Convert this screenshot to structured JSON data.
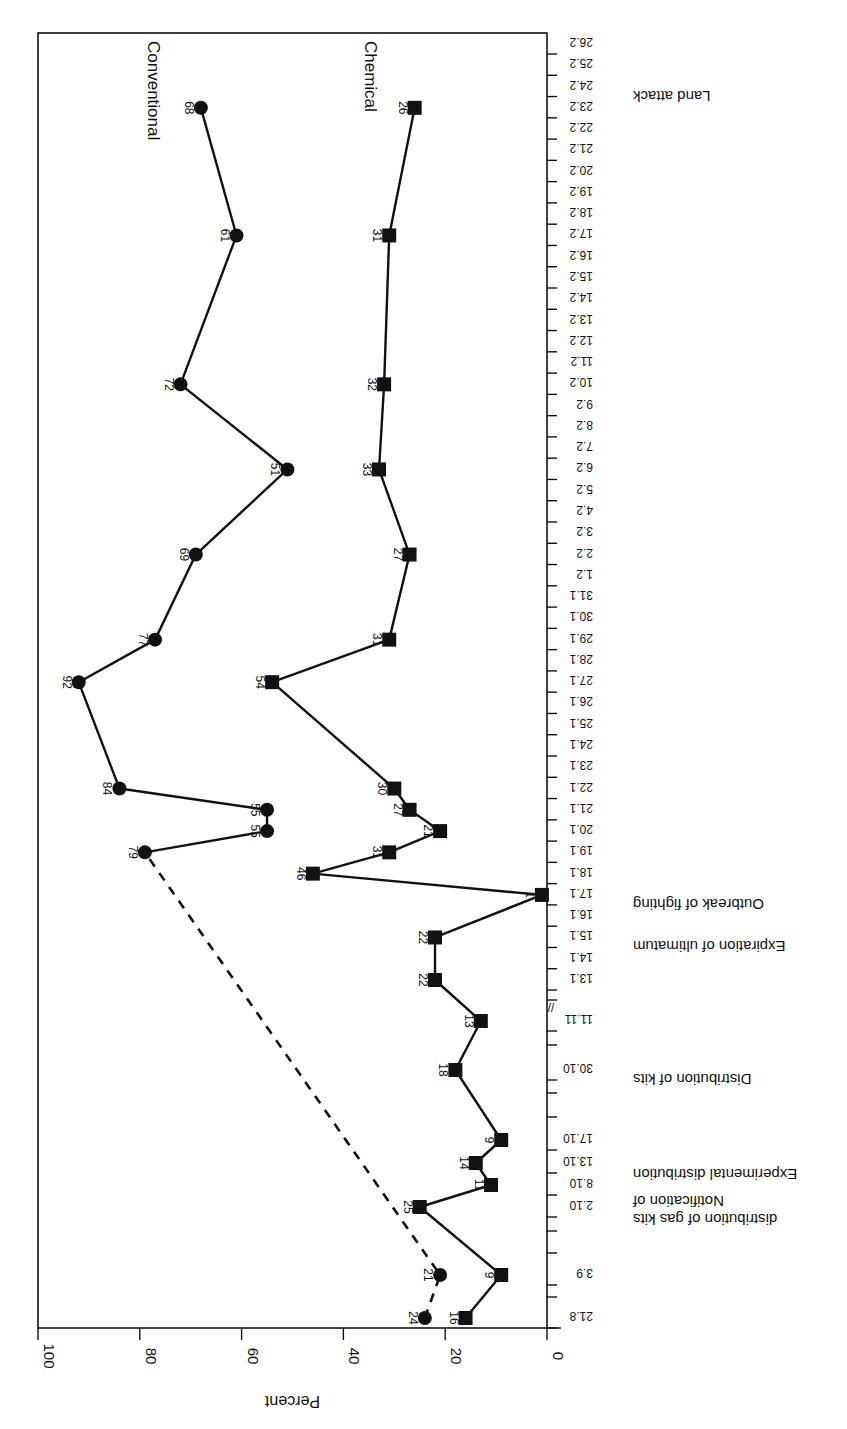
{
  "chart_data": {
    "type": "line",
    "orientation_note": "figure printed rotated 180/90 degrees; percent axis horizontal at bottom, dates along right edge",
    "title": "",
    "xlabel": "Date",
    "ylabel": "Percent",
    "ylim": [
      0,
      100
    ],
    "y_ticks": [
      0,
      20,
      40,
      60,
      80,
      100
    ],
    "grid": false,
    "legend_position": "inline labels near top of each series",
    "date_ticks": [
      "21.8",
      "3.9",
      "2.10",
      "8.10",
      "13.10",
      "17.10",
      "30.10",
      "11.11",
      "13.1",
      "14.1",
      "15.1",
      "16.1",
      "17.1",
      "18.1",
      "19.1",
      "20.1",
      "21.1",
      "22.1",
      "23.1",
      "24.1",
      "25.1",
      "26.1",
      "27.1",
      "28.1",
      "29.1",
      "30.1",
      "31.1",
      "1.2",
      "2.2",
      "3.2",
      "4.2",
      "5.2",
      "6.2",
      "7.2",
      "8.2",
      "9.2",
      "10.2",
      "11.2",
      "12.2",
      "13.2",
      "14.2",
      "15.2",
      "16.2",
      "17.2",
      "18.2",
      "19.2",
      "20.2",
      "21.2",
      "22.2",
      "23.2",
      "24.2",
      "25.2",
      "26.2"
    ],
    "axis_break_marker": "//",
    "series": [
      {
        "name": "Conventional",
        "marker": "circle",
        "points": [
          {
            "date": "21.8",
            "value": 24,
            "style": "dashed"
          },
          {
            "date": "3.9",
            "value": 21,
            "style": "dashed"
          },
          {
            "date": "19.1",
            "value": 79,
            "style": "solid"
          },
          {
            "date": "20.1",
            "value": 55,
            "style": "solid"
          },
          {
            "date": "21.1",
            "value": 55,
            "style": "solid"
          },
          {
            "date": "22.1",
            "value": 84,
            "style": "solid"
          },
          {
            "date": "27.1",
            "value": 92,
            "style": "solid"
          },
          {
            "date": "29.1",
            "value": 77,
            "style": "solid"
          },
          {
            "date": "2.2",
            "value": 69,
            "style": "solid"
          },
          {
            "date": "6.2",
            "value": 51,
            "style": "solid"
          },
          {
            "date": "10.2",
            "value": 72,
            "style": "solid"
          },
          {
            "date": "17.2",
            "value": 61,
            "style": "solid"
          },
          {
            "date": "23.2",
            "value": 68,
            "style": "solid"
          }
        ]
      },
      {
        "name": "Chemical",
        "marker": "square",
        "points": [
          {
            "date": "21.8",
            "value": 16
          },
          {
            "date": "3.9",
            "value": 9
          },
          {
            "date": "2.10",
            "value": 25
          },
          {
            "date": "8.10",
            "value": 11
          },
          {
            "date": "13.10",
            "value": 14
          },
          {
            "date": "17.10",
            "value": 9
          },
          {
            "date": "30.10",
            "value": 18
          },
          {
            "date": "11.11",
            "value": 13
          },
          {
            "date": "13.1",
            "value": 22
          },
          {
            "date": "15.1",
            "value": 22
          },
          {
            "date": "17.1",
            "value": 1
          },
          {
            "date": "18.1",
            "value": 46
          },
          {
            "date": "19.1",
            "value": 31
          },
          {
            "date": "20.1",
            "value": 21
          },
          {
            "date": "21.1",
            "value": 27
          },
          {
            "date": "22.1",
            "value": 30
          },
          {
            "date": "27.1",
            "value": 54
          },
          {
            "date": "29.1",
            "value": 31
          },
          {
            "date": "2.2",
            "value": 27
          },
          {
            "date": "6.2",
            "value": 33
          },
          {
            "date": "10.2",
            "value": 32
          },
          {
            "date": "17.2",
            "value": 31
          },
          {
            "date": "23.2",
            "value": 26
          }
        ]
      }
    ],
    "annotations": [
      {
        "text": "Notification of",
        "text2": "distribution of gas kits",
        "date": "2.10"
      },
      {
        "text": "Experimental distribution",
        "date": "13.10"
      },
      {
        "text": "Distribution of kits",
        "date": "30.10"
      },
      {
        "text": "Expiration of ultimatum",
        "date": "15.1"
      },
      {
        "text": "Outbreak of fighting",
        "date": "17.1"
      },
      {
        "text": "Land attack",
        "date": "24.2"
      }
    ]
  }
}
